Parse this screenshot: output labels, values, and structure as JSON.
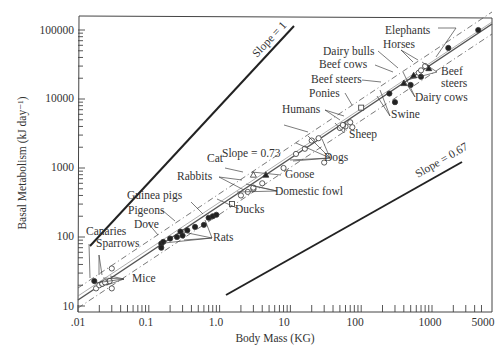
{
  "chart_data": {
    "type": "scatter",
    "title": "",
    "xlabel": "Body Mass (KG)",
    "ylabel": "Basal Metabolism (kJ day⁻¹)",
    "xscale": "log",
    "yscale": "log",
    "xlim": [
      0.01,
      5000
    ],
    "ylim": [
      10,
      120000
    ],
    "x_ticks": [
      ".01",
      "0.1",
      "1.0",
      "10",
      "100",
      "1000",
      "5000"
    ],
    "y_ticks": [
      "10",
      "100",
      "1000",
      "10000",
      "100000"
    ],
    "grid": false,
    "reference_lines": [
      {
        "label": "Slope = 1",
        "slope": 1,
        "from": [
          0.017,
          160
        ],
        "to": [
          3.5,
          30000
        ]
      },
      {
        "label": "Slope = 0.73",
        "slope": 0.73,
        "style": "solid regression with dashed confidence bands",
        "from": [
          0.01,
          12
        ],
        "to": [
          5000,
          100000
        ]
      },
      {
        "label": "Slope = 0.67",
        "slope": 0.67,
        "from": [
          1.3,
          12
        ],
        "to": [
          3500,
          2900
        ]
      }
    ],
    "series": [
      {
        "name": "Mice",
        "marker": "open-circle",
        "points": [
          [
            0.018,
            18
          ],
          [
            0.02,
            20
          ],
          [
            0.022,
            21
          ],
          [
            0.025,
            22
          ],
          [
            0.03,
            18
          ],
          [
            0.028,
            23
          ],
          [
            0.03,
            35
          ]
        ]
      },
      {
        "name": "Canaries",
        "marker": "filled-circle",
        "points": [
          [
            0.017,
            23
          ]
        ]
      },
      {
        "name": "Sparrows",
        "marker": "open-circle",
        "points": [
          [
            0.022,
            21
          ],
          [
            0.024,
            22
          ]
        ]
      },
      {
        "name": "Dove",
        "marker": "filled-circle",
        "points": [
          [
            0.15,
            80
          ]
        ]
      },
      {
        "name": "Pigeons",
        "marker": "filled-circle",
        "points": [
          [
            0.28,
            120
          ],
          [
            0.35,
            125
          ]
        ]
      },
      {
        "name": "Guinea pigs",
        "marker": "filled-circle",
        "points": [
          [
            0.45,
            140
          ],
          [
            0.6,
            150
          ]
        ]
      },
      {
        "name": "Rats",
        "marker": "filled-circle",
        "points": [
          [
            0.15,
            70
          ],
          [
            0.16,
            85
          ],
          [
            0.2,
            95
          ],
          [
            0.25,
            100
          ],
          [
            0.3,
            105
          ],
          [
            0.7,
            190
          ],
          [
            0.8,
            200
          ],
          [
            0.9,
            210
          ]
        ]
      },
      {
        "name": "Ducks",
        "marker": "open-square",
        "points": [
          [
            1.5,
            300
          ]
        ]
      },
      {
        "name": "Cat",
        "marker": "open-triangle",
        "points": [
          [
            3,
            800
          ]
        ]
      },
      {
        "name": "Rabbits",
        "marker": "open-circle",
        "points": [
          [
            2.5,
            450
          ],
          [
            3,
            500
          ]
        ]
      },
      {
        "name": "Goose",
        "marker": "filled-triangle",
        "points": [
          [
            4.5,
            800
          ]
        ]
      },
      {
        "name": "Domestic fowl",
        "marker": "open-circle",
        "points": [
          [
            2,
            400
          ],
          [
            3,
            520
          ],
          [
            4,
            600
          ]
        ]
      },
      {
        "name": "Dogs",
        "marker": "open-circle",
        "points": [
          [
            8,
            1000
          ],
          [
            12,
            1600
          ],
          [
            16,
            1900
          ],
          [
            20,
            2500
          ],
          [
            25,
            2700
          ],
          [
            30,
            1200
          ]
        ]
      },
      {
        "name": "Humans",
        "marker": "open-circle",
        "points": [
          [
            60,
            4000
          ],
          [
            70,
            4600
          ]
        ]
      },
      {
        "name": "Sheep",
        "marker": "open-circle",
        "points": [
          [
            50,
            3800
          ],
          [
            55,
            4200
          ],
          [
            75,
            3900
          ]
        ]
      },
      {
        "name": "Ponies",
        "marker": "open-square",
        "points": [
          [
            100,
            7500
          ]
        ]
      },
      {
        "name": "Swine",
        "marker": "filled-circle",
        "points": [
          [
            250,
            12000
          ],
          [
            300,
            9000
          ]
        ]
      },
      {
        "name": "Beef steers",
        "marker": "filled-triangle",
        "points": [
          [
            400,
            17000
          ],
          [
            900,
            28000
          ]
        ]
      },
      {
        "name": "Beef cows",
        "marker": "filled-triangle",
        "points": [
          [
            550,
            22000
          ]
        ]
      },
      {
        "name": "Dairy bulls",
        "marker": "open-circle",
        "points": [
          [
            650,
            24000
          ]
        ]
      },
      {
        "name": "Dairy cows",
        "marker": "filled-circle",
        "points": [
          [
            500,
            16000
          ],
          [
            700,
            21000
          ]
        ]
      },
      {
        "name": "Horses",
        "marker": "open-circle",
        "points": [
          [
            700,
            26000
          ],
          [
            800,
            30000
          ]
        ]
      },
      {
        "name": "Elephants",
        "marker": "filled-circle",
        "points": [
          [
            1700,
            55000
          ],
          [
            4500,
            100000
          ]
        ]
      }
    ]
  },
  "annotations": {
    "slope1": "Slope = 1",
    "slope073": "Slope = 0.73",
    "slope067": "Slope = 0.67",
    "elephants": "Elephants",
    "horses": "Horses",
    "dairy_bulls": "Dairy bulls",
    "beef_cows": "Beef cows",
    "beef_steers_left": "Beef steers",
    "beef_steers_right_1": "Beef",
    "beef_steers_right_2": "steers",
    "ponies": "Ponies",
    "dairy_cows": "Dairy cows",
    "swine": "Swine",
    "humans": "Humans",
    "sheep": "Sheep",
    "dogs": "Dogs",
    "cat": "Cat",
    "rabbits": "Rabbits",
    "goose": "Goose",
    "domestic_fowl": "Domestic fowl",
    "ducks": "Ducks",
    "guinea_pigs": "Guinea pigs",
    "pigeons": "Pigeons",
    "dove": "Dove",
    "rats": "Rats",
    "canaries": "Canaries",
    "sparrows": "Sparrows",
    "mice": "Mice"
  },
  "axes": {
    "xlabel": "Body Mass (KG)",
    "ylabel": "Basal Metabolism (kJ day⁻¹)",
    "x_ticks": [
      ".01",
      "0.1",
      "1.0",
      "10",
      "100",
      "1000",
      "5000"
    ],
    "y_ticks": [
      "10",
      "100",
      "1000",
      "10000",
      "100000"
    ]
  }
}
